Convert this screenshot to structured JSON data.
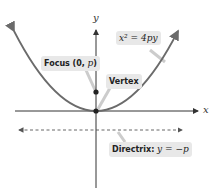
{
  "diagram": {
    "type": "parabola",
    "axes": {
      "x_label": "x",
      "y_label": "y"
    },
    "labels": {
      "equation": {
        "lhs": "x² = 4",
        "rhs": "py"
      },
      "focus": {
        "text": "Focus",
        "coords": "(0, ",
        "p": "p",
        "close": ")"
      },
      "vertex": "Vertex",
      "directrix": {
        "text": "Directrix:",
        "eq": "y = −p"
      }
    },
    "colors": {
      "curve": "#6b6b6b",
      "axis": "#333333",
      "label_bg": "#e8e8e8",
      "dashed": "#555555"
    }
  }
}
